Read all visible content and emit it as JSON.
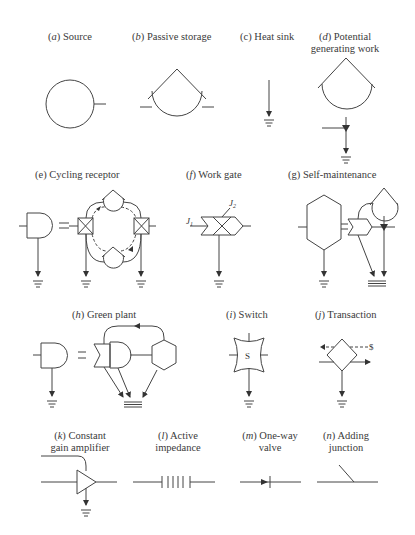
{
  "figure": {
    "symbols": [
      {
        "id": "a",
        "letter": "a",
        "name": "Source",
        "lines": [
          "Source"
        ]
      },
      {
        "id": "b",
        "letter": "b",
        "name": "Passive storage",
        "lines": [
          "Passive storage"
        ]
      },
      {
        "id": "c",
        "letter": "c",
        "name": "Heat sink",
        "lines": [
          "Heat sink"
        ]
      },
      {
        "id": "d",
        "letter": "d",
        "name": "Potential generating work",
        "lines": [
          "Potential",
          "generating work"
        ]
      },
      {
        "id": "e",
        "letter": "e",
        "name": "Cycling receptor",
        "lines": [
          "Cycling receptor"
        ]
      },
      {
        "id": "f",
        "letter": "f",
        "name": "Work gate",
        "lines": [
          "Work gate"
        ]
      },
      {
        "id": "g",
        "letter": "g",
        "name": "Self-maintenance",
        "lines": [
          "Self-maintenance"
        ]
      },
      {
        "id": "h",
        "letter": "h",
        "name": "Green plant",
        "lines": [
          "Green plant"
        ]
      },
      {
        "id": "i",
        "letter": "i",
        "name": "Switch",
        "lines": [
          "Switch"
        ]
      },
      {
        "id": "j",
        "letter": "j",
        "name": "Transaction",
        "lines": [
          "Transaction"
        ]
      },
      {
        "id": "k",
        "letter": "k",
        "name": "Constant gain amplifier",
        "lines": [
          "Constant",
          "gain amplifier"
        ]
      },
      {
        "id": "l",
        "letter": "l",
        "name": "Active impedance",
        "lines": [
          "Active",
          "impedance"
        ]
      },
      {
        "id": "m",
        "letter": "m",
        "name": "One-way valve",
        "lines": [
          "One-way",
          "valve"
        ]
      },
      {
        "id": "n",
        "letter": "n",
        "name": "Adding junction",
        "lines": [
          "Adding",
          "junction"
        ]
      }
    ],
    "annotations": {
      "switch_symbol": "S",
      "transaction_money": "$",
      "work_gate_input_1": "J",
      "work_gate_input_1_sub": "1",
      "work_gate_input_2": "J",
      "work_gate_input_2_sub": "2"
    }
  },
  "labels": {
    "a": {
      "prefix": "(",
      "letter": "a",
      "suffix": ")",
      "l1": "Source"
    },
    "b": {
      "prefix": "(",
      "letter": "b",
      "suffix": ")",
      "l1": "Passive storage"
    },
    "c": {
      "prefix": "(",
      "letter": "c",
      "suffix": ")",
      "l1": "Heat sink"
    },
    "d": {
      "prefix": "(",
      "letter": "d",
      "suffix": ")",
      "l1": "Potential",
      "l2": "generating work"
    },
    "e": {
      "prefix": "(",
      "letter": "e",
      "suffix": ")",
      "l1": "Cycling receptor"
    },
    "f": {
      "prefix": "(",
      "letter": "f",
      "suffix": ")",
      "l1": "Work gate"
    },
    "g": {
      "prefix": "(",
      "letter": "g",
      "suffix": ")",
      "l1": "Self-maintenance"
    },
    "h": {
      "prefix": "(",
      "letter": "h",
      "suffix": ")",
      "l1": "Green plant"
    },
    "i": {
      "prefix": "(",
      "letter": "i",
      "suffix": ")",
      "l1": "Switch"
    },
    "j": {
      "prefix": "(",
      "letter": "j",
      "suffix": ")",
      "l1": "Transaction"
    },
    "k": {
      "prefix": "(",
      "letter": "k",
      "suffix": ")",
      "l1": "Constant",
      "l2": "gain amplifier"
    },
    "l": {
      "prefix": "(",
      "letter": "l",
      "suffix": ")",
      "l1": "Active",
      "l2": "impedance"
    },
    "m": {
      "prefix": "(",
      "letter": "m",
      "suffix": ")",
      "l1": "One-way",
      "l2": "valve"
    },
    "n": {
      "prefix": "(",
      "letter": "n",
      "suffix": ")",
      "l1": "Adding",
      "l2": "junction"
    }
  }
}
